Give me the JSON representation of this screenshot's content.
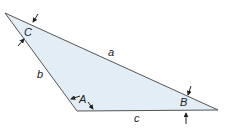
{
  "diagram": {
    "type": "triangle",
    "fill_color": "#e3edf5",
    "stroke_color": "#555555",
    "vertices": {
      "C": {
        "label": "C"
      },
      "A": {
        "label": "A"
      },
      "B": {
        "label": "B"
      }
    },
    "sides": {
      "a": {
        "label": "a"
      },
      "b": {
        "label": "b"
      },
      "c": {
        "label": "c"
      }
    }
  }
}
